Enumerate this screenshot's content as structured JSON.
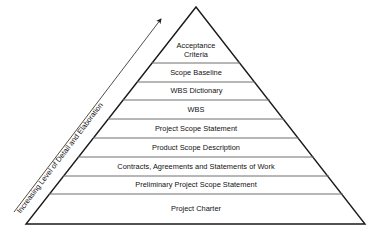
{
  "diagram": {
    "type": "pyramid",
    "title": "Increasing Level of Detail and Elaboration",
    "axis_arrow": {
      "label": "Increasing Level of Detail and Elaboration",
      "direction": "up-right",
      "icon": "arrow-up-right-icon"
    },
    "colors": {
      "outline": "#1a1a1a",
      "divider": "#6f6f6f",
      "fill": "#ffffff",
      "text": "#111111"
    },
    "tiers": [
      {
        "label": "Acceptance\nCriteria",
        "level": 1
      },
      {
        "label": "Scope Baseline",
        "level": 2
      },
      {
        "label": "WBS Dictionary",
        "level": 3
      },
      {
        "label": "WBS",
        "level": 4
      },
      {
        "label": "Project Scope Statement",
        "level": 5
      },
      {
        "label": "Product Scope Description",
        "level": 6
      },
      {
        "label": "Contracts, Agreements and Statements of Work",
        "level": 7
      },
      {
        "label": "Preliminary Project Scope Statement",
        "level": 8
      },
      {
        "label": "Project Charter",
        "level": 9
      }
    ]
  }
}
